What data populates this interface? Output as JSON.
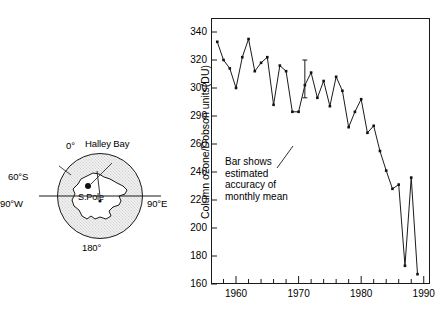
{
  "figure": {
    "map": {
      "labels": {
        "lat60s": "60°S",
        "lon0": "0°",
        "station": "Halley Bay",
        "lon90w": "90°W",
        "lon90e": "90°E",
        "pole": "S.Pole",
        "lon180": "180°"
      }
    },
    "annotation": "Bar shows\nestimated\naccuracy of\nmonthly mean"
  },
  "chart_data": {
    "type": "line",
    "title": "",
    "xlabel": "",
    "ylabel": "Column ozone/Dobson units(DU)",
    "xlim": [
      1956,
      1991
    ],
    "ylim": [
      160,
      350
    ],
    "yticks": [
      340,
      320,
      300,
      280,
      260,
      240,
      220,
      200,
      180,
      160
    ],
    "ytick_labels": [
      "340",
      "320",
      "300",
      "290",
      "260",
      "240",
      "220",
      "200",
      "180",
      "160"
    ],
    "xticks": [
      1960,
      1970,
      1980,
      1990
    ],
    "xtick_labels": [
      "1960",
      "1970",
      "1980",
      "1990"
    ],
    "x_minor_step": 2,
    "grid": false,
    "legend": null,
    "marker": "square",
    "x": [
      1957,
      1958,
      1959,
      1960,
      1961,
      1962,
      1963,
      1964,
      1965,
      1966,
      1967,
      1968,
      1969,
      1970,
      1971,
      1972,
      1973,
      1974,
      1975,
      1976,
      1977,
      1978,
      1979,
      1980,
      1981,
      1982,
      1983,
      1984,
      1985,
      1986,
      1987,
      1988,
      1989
    ],
    "values": [
      333,
      320,
      314,
      300,
      322,
      335,
      312,
      318,
      322,
      288,
      316,
      312,
      283,
      283,
      302,
      311,
      293,
      305,
      287,
      308,
      298,
      272,
      283,
      292,
      268,
      273,
      255,
      241,
      228,
      231,
      173,
      236,
      167
    ],
    "errorbar": {
      "x": 1971,
      "y": 302,
      "low": 293,
      "high": 320
    }
  }
}
